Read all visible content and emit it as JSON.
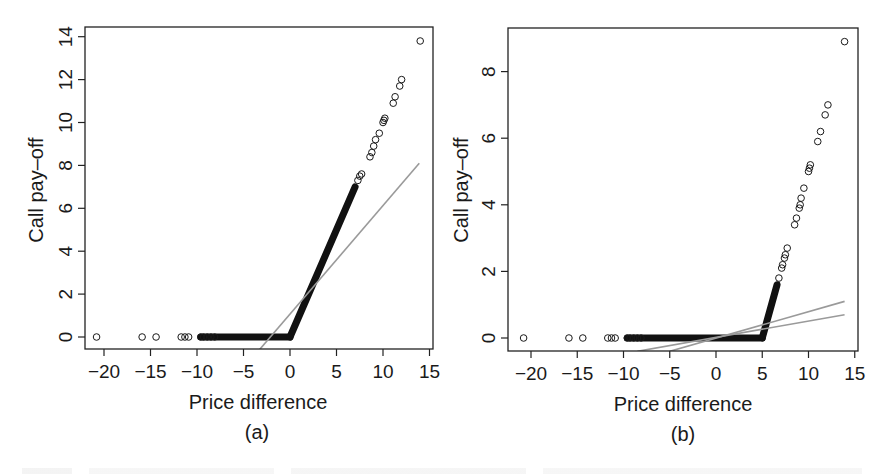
{
  "figure": {
    "panels": [
      "(a)",
      "(b)"
    ]
  },
  "chart_data": [
    {
      "type": "scatter",
      "panel_label": "(a)",
      "title": "",
      "xlabel": "Price difference",
      "ylabel": "Call pay–off",
      "xlim": [
        -22.5,
        15.5
      ],
      "ylim": [
        -0.6,
        14.6
      ],
      "xticks": [
        -20,
        -15,
        -10,
        -5,
        0,
        5,
        10,
        15
      ],
      "xtick_labels": [
        "−20",
        "−15",
        "−10",
        "−5",
        "0",
        "5",
        "10",
        "15"
      ],
      "yticks": [
        0,
        2,
        4,
        6,
        8,
        10,
        12,
        14
      ],
      "ytick_labels": [
        "0",
        "2",
        "4",
        "6",
        "8",
        "10",
        "12",
        "14"
      ],
      "grid": false,
      "legend": null,
      "strike": 0,
      "payoff_relation": "y = max(0, x)",
      "marker": "open-circle",
      "isolated_points": [
        [
          -20.8,
          0
        ],
        [
          -15.9,
          0
        ],
        [
          -14.4,
          0
        ],
        [
          -11.7,
          0
        ],
        [
          -11.3,
          0
        ],
        [
          -10.9,
          0
        ],
        [
          7.3,
          7.3
        ],
        [
          7.5,
          7.5
        ],
        [
          7.7,
          7.6
        ],
        [
          8.6,
          8.4
        ],
        [
          8.8,
          8.6
        ],
        [
          9.0,
          8.9
        ],
        [
          9.2,
          9.2
        ],
        [
          9.6,
          9.5
        ],
        [
          10.0,
          10.0
        ],
        [
          10.1,
          10.1
        ],
        [
          10.2,
          10.2
        ],
        [
          11.1,
          10.9
        ],
        [
          11.3,
          11.2
        ],
        [
          11.8,
          11.7
        ],
        [
          12.0,
          12.0
        ],
        [
          14.0,
          13.8
        ]
      ],
      "dense_segments": [
        {
          "from": [
            -9.6,
            0
          ],
          "to": [
            0,
            0
          ],
          "description": "dense band of points at zero pay-off"
        },
        {
          "from": [
            0,
            0
          ],
          "to": [
            7.0,
            7.0
          ],
          "description": "dense band of points along pay-off line"
        }
      ],
      "regression_lines": [
        {
          "from": [
            -3.3,
            -0.6
          ],
          "to": [
            13.9,
            8.1
          ],
          "color": "#9a9a9a"
        }
      ]
    },
    {
      "type": "scatter",
      "panel_label": "(b)",
      "title": "",
      "xlabel": "Price difference",
      "ylabel": "Call pay–off",
      "xlim": [
        -22.5,
        15.5
      ],
      "ylim": [
        -0.4,
        9.3
      ],
      "xticks": [
        -20,
        -15,
        -10,
        -5,
        0,
        5,
        10,
        15
      ],
      "xtick_labels": [
        "−20",
        "−15",
        "−10",
        "−5",
        "0",
        "5",
        "10",
        "15"
      ],
      "yticks": [
        0,
        2,
        4,
        6,
        8
      ],
      "ytick_labels": [
        "0",
        "2",
        "4",
        "6",
        "8"
      ],
      "grid": false,
      "legend": null,
      "strike": 5,
      "payoff_relation": "y = max(0, x - 5)",
      "marker": "open-circle",
      "isolated_points": [
        [
          -20.8,
          0
        ],
        [
          -15.9,
          0
        ],
        [
          -14.4,
          0
        ],
        [
          -11.7,
          0
        ],
        [
          -11.3,
          0
        ],
        [
          -10.9,
          0
        ],
        [
          6.8,
          1.8
        ],
        [
          7.1,
          2.1
        ],
        [
          7.2,
          2.2
        ],
        [
          7.4,
          2.4
        ],
        [
          7.5,
          2.5
        ],
        [
          7.7,
          2.7
        ],
        [
          8.5,
          3.4
        ],
        [
          8.7,
          3.6
        ],
        [
          9.0,
          3.9
        ],
        [
          9.1,
          4.0
        ],
        [
          9.2,
          4.2
        ],
        [
          9.5,
          4.5
        ],
        [
          10.0,
          5.0
        ],
        [
          10.1,
          5.1
        ],
        [
          10.2,
          5.2
        ],
        [
          11.0,
          5.9
        ],
        [
          11.3,
          6.2
        ],
        [
          11.8,
          6.7
        ],
        [
          12.1,
          7.0
        ],
        [
          13.9,
          8.9
        ]
      ],
      "dense_segments": [
        {
          "from": [
            -9.6,
            0
          ],
          "to": [
            5,
            0
          ],
          "description": "dense band of points at zero pay-off"
        },
        {
          "from": [
            5,
            0
          ],
          "to": [
            6.6,
            1.6
          ],
          "description": "dense band of points along pay-off line"
        }
      ],
      "regression_lines": [
        {
          "from": [
            -5.0,
            -0.4
          ],
          "to": [
            13.9,
            1.1
          ],
          "color": "#a8a8a8"
        },
        {
          "from": [
            -8.5,
            -0.4
          ],
          "to": [
            13.9,
            0.7
          ],
          "color": "#a8a8a8"
        }
      ]
    }
  ]
}
